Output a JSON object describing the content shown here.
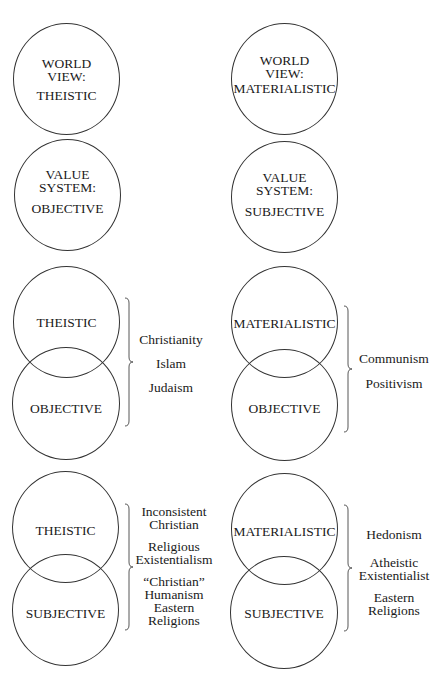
{
  "single_circles": {
    "worldview_theistic": {
      "lines": [
        "WORLD",
        "VIEW:",
        "THEISTIC"
      ]
    },
    "worldview_materialistic": {
      "lines": [
        "WORLD",
        "VIEW:",
        "MATERIALISTIC"
      ]
    },
    "value_objective": {
      "lines": [
        "VALUE",
        "SYSTEM:",
        "OBJECTIVE"
      ]
    },
    "value_subjective": {
      "lines": [
        "VALUE",
        "SYSTEM:",
        "SUBJECTIVE"
      ]
    }
  },
  "combinations": [
    {
      "top": "THEISTIC",
      "bottom": "OBJECTIVE",
      "examples": [
        "Christianity",
        "Islam",
        "Judaism"
      ]
    },
    {
      "top": "MATERIALISTIC",
      "bottom": "OBJECTIVE",
      "examples": [
        "Communism",
        "Positivism"
      ]
    },
    {
      "top": "THEISTIC",
      "bottom": "SUBJECTIVE",
      "examples": [
        "Inconsistent Christian",
        "Religious Existentialism",
        "“Christian” Humanism",
        "Eastern Religions"
      ],
      "example_lines": [
        [
          "Inconsistent",
          "Christian"
        ],
        [
          "Religious",
          "Existentialism"
        ],
        [
          "“Christian”",
          "Humanism",
          "Eastern",
          "Religions"
        ]
      ]
    },
    {
      "top": "MATERIALISTIC",
      "bottom": "SUBJECTIVE",
      "examples": [
        "Hedonism",
        "Atheistic Existentialist",
        "Eastern Religions"
      ],
      "example_lines": [
        [
          "Hedonism"
        ],
        [
          "Atheistic",
          "Existentialist"
        ],
        [
          "Eastern",
          "Religions"
        ]
      ]
    }
  ]
}
